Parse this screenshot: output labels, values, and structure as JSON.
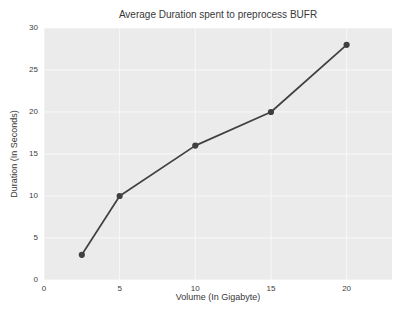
{
  "chart_data": {
    "type": "line",
    "title": "Average Duration spent to preprocess BUFR",
    "xlabel": "Volume (In Gigabyte)",
    "ylabel": "Duration (In Seconds)",
    "x": [
      2.5,
      5,
      10,
      15,
      20
    ],
    "y": [
      3,
      10,
      16,
      20,
      28
    ],
    "xlim": [
      0,
      23
    ],
    "ylim": [
      0,
      30
    ],
    "xticks": [
      0,
      5,
      10,
      15,
      20
    ],
    "yticks": [
      0,
      5,
      10,
      15,
      20,
      25,
      30
    ],
    "grid": true,
    "legend": "none",
    "colors": {
      "line": "#404040",
      "marker": "#404040",
      "plot_background": "#ebebeb",
      "grid": "#f8f8f8",
      "text": "#3a3a3a",
      "figure_background": "#ffffff"
    }
  }
}
